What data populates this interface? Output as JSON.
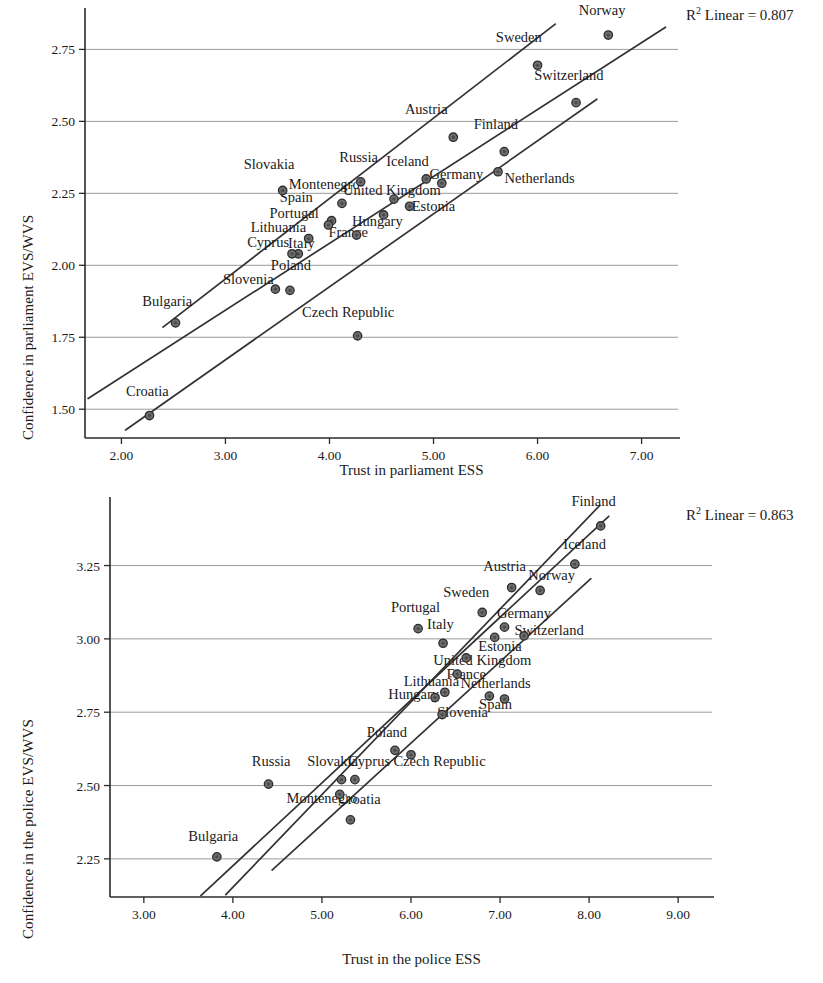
{
  "chart_data": [
    {
      "id": "parliament",
      "type": "scatter",
      "title": "",
      "xlabel": "Trust in parliament ESS",
      "ylabel": "Confidence in parliament EVS/WVS",
      "annotation": "R2 Linear = 0.807",
      "annotation_base": "R",
      "annotation_sup": "2",
      "annotation_rest": " Linear = 0.807",
      "r_squared": 0.807,
      "xlim": [
        1.65,
        7.35
      ],
      "ylim": [
        1.4,
        2.88
      ],
      "xticks": [
        "2.00",
        "3.00",
        "4.00",
        "5.00",
        "6.00",
        "7.00"
      ],
      "xtick_values": [
        2.0,
        3.0,
        4.0,
        5.0,
        6.0,
        7.0
      ],
      "yticks": [
        "1.50",
        "1.75",
        "2.00",
        "2.25",
        "2.50",
        "2.75"
      ],
      "ytick_values": [
        1.5,
        1.75,
        2.0,
        2.25,
        2.5,
        2.75
      ],
      "grid": "horizontal",
      "legend": "none",
      "points": [
        {
          "label": "Norway",
          "x": 6.68,
          "y": 2.8,
          "lx": 6.62,
          "ly": 2.87,
          "anchor": "middle"
        },
        {
          "label": "Sweden",
          "x": 6.0,
          "y": 2.695,
          "lx": 5.82,
          "ly": 2.775,
          "anchor": "middle"
        },
        {
          "label": "Switzerland",
          "x": 6.37,
          "y": 2.565,
          "lx": 6.3,
          "ly": 2.645,
          "anchor": "middle"
        },
        {
          "label": "Austria",
          "x": 5.19,
          "y": 2.445,
          "lx": 4.93,
          "ly": 2.525,
          "anchor": "middle"
        },
        {
          "label": "Finland",
          "x": 5.68,
          "y": 2.395,
          "lx": 5.6,
          "ly": 2.475,
          "anchor": "middle"
        },
        {
          "label": "Netherlands",
          "x": 5.62,
          "y": 2.325,
          "lx": 6.02,
          "ly": 2.285,
          "anchor": "middle"
        },
        {
          "label": "Germany",
          "x": 5.08,
          "y": 2.285,
          "lx": 5.22,
          "ly": 2.3,
          "anchor": "middle"
        },
        {
          "label": "Iceland",
          "x": 4.93,
          "y": 2.3,
          "lx": 4.75,
          "ly": 2.345,
          "anchor": "middle"
        },
        {
          "label": "Russia",
          "x": 4.3,
          "y": 2.29,
          "lx": 4.28,
          "ly": 2.36,
          "anchor": "middle"
        },
        {
          "label": "Slovakia",
          "x": 3.55,
          "y": 2.26,
          "lx": 3.42,
          "ly": 2.335,
          "anchor": "middle"
        },
        {
          "label": "United Kingdom",
          "x": 4.62,
          "y": 2.23,
          "lx": 4.6,
          "ly": 2.245,
          "anchor": "middle"
        },
        {
          "label": "Montenegro",
          "x": 4.12,
          "y": 2.215,
          "lx": 3.95,
          "ly": 2.265,
          "anchor": "middle"
        },
        {
          "label": "Estonia",
          "x": 4.77,
          "y": 2.205,
          "lx": 5.0,
          "ly": 2.19,
          "anchor": "middle"
        },
        {
          "label": "Spain",
          "x": 4.02,
          "y": 2.155,
          "lx": 3.68,
          "ly": 2.22,
          "anchor": "middle"
        },
        {
          "label": "Hungary",
          "x": 4.52,
          "y": 2.175,
          "lx": 4.46,
          "ly": 2.135,
          "anchor": "middle"
        },
        {
          "label": "Portugal",
          "x": 3.99,
          "y": 2.14,
          "lx": 3.66,
          "ly": 2.165,
          "anchor": "middle"
        },
        {
          "label": "France",
          "x": 4.26,
          "y": 2.105,
          "lx": 4.18,
          "ly": 2.1,
          "anchor": "middle"
        },
        {
          "label": "Lithuania",
          "x": 3.8,
          "y": 2.093,
          "lx": 3.51,
          "ly": 2.115,
          "anchor": "middle"
        },
        {
          "label": "Italy",
          "x": 3.7,
          "y": 2.04,
          "lx": 3.73,
          "ly": 2.06,
          "anchor": "middle"
        },
        {
          "label": "Cyprus",
          "x": 3.64,
          "y": 2.04,
          "lx": 3.41,
          "ly": 2.062,
          "anchor": "middle"
        },
        {
          "label": "Poland",
          "x": 3.62,
          "y": 1.913,
          "lx": 3.63,
          "ly": 1.985,
          "anchor": "middle"
        },
        {
          "label": "Slovenia",
          "x": 3.48,
          "y": 1.917,
          "lx": 3.22,
          "ly": 1.935,
          "anchor": "middle"
        },
        {
          "label": "Bulgaria",
          "x": 2.52,
          "y": 1.8,
          "lx": 2.44,
          "ly": 1.858,
          "anchor": "middle"
        },
        {
          "label": "Czech Republic",
          "x": 4.27,
          "y": 1.755,
          "lx": 4.18,
          "ly": 1.822,
          "anchor": "middle"
        },
        {
          "label": "Croatia",
          "x": 2.27,
          "y": 1.478,
          "lx": 2.25,
          "ly": 1.545,
          "anchor": "middle"
        }
      ],
      "fit_lines": [
        {
          "name": "regression-line",
          "x1": 1.68,
          "y1": 1.537,
          "x2": 7.23,
          "y2": 2.827
        },
        {
          "name": "upper-confidence-line",
          "x1": 2.4,
          "y1": 1.785,
          "x2": 6.17,
          "y2": 2.838
        },
        {
          "name": "lower-confidence-line",
          "x1": 2.04,
          "y1": 1.428,
          "x2": 6.57,
          "y2": 2.577
        }
      ]
    },
    {
      "id": "police",
      "type": "scatter",
      "title": "",
      "xlabel": "Trust in the police ESS",
      "ylabel": "Confidence in the police EVS/WVS",
      "annotation": "R2 Linear = 0.863",
      "annotation_base": "R",
      "annotation_sup": "2",
      "annotation_rest": " Linear = 0.863",
      "r_squared": 0.863,
      "xlim": [
        2.62,
        9.38
      ],
      "ylim": [
        2.12,
        3.47
      ],
      "xticks": [
        "3.00",
        "4.00",
        "5.00",
        "6.00",
        "7.00",
        "8.00",
        "9.00"
      ],
      "xtick_values": [
        3.0,
        4.0,
        5.0,
        6.0,
        7.0,
        8.0,
        9.0
      ],
      "yticks": [
        "2.25",
        "2.50",
        "2.75",
        "3.00",
        "3.25"
      ],
      "ytick_values": [
        2.25,
        2.5,
        2.75,
        3.0,
        3.25
      ],
      "grid": "horizontal",
      "legend": "none",
      "points": [
        {
          "label": "Finland",
          "x": 8.13,
          "y": 3.385,
          "lx": 8.05,
          "ly": 3.452,
          "anchor": "middle"
        },
        {
          "label": "Iceland",
          "x": 7.84,
          "y": 3.255,
          "lx": 7.95,
          "ly": 3.305,
          "anchor": "middle"
        },
        {
          "label": "Austria",
          "x": 7.13,
          "y": 3.175,
          "lx": 7.05,
          "ly": 3.233,
          "anchor": "middle"
        },
        {
          "label": "Norway",
          "x": 7.45,
          "y": 3.165,
          "lx": 7.58,
          "ly": 3.2,
          "anchor": "middle"
        },
        {
          "label": "Sweden",
          "x": 6.8,
          "y": 3.09,
          "lx": 6.62,
          "ly": 3.143,
          "anchor": "middle"
        },
        {
          "label": "Germany",
          "x": 7.05,
          "y": 3.04,
          "lx": 7.27,
          "ly": 3.07,
          "anchor": "middle"
        },
        {
          "label": "Switzerland",
          "x": 7.27,
          "y": 3.01,
          "lx": 7.55,
          "ly": 3.013,
          "anchor": "middle"
        },
        {
          "label": "Portugal",
          "x": 6.08,
          "y": 3.035,
          "lx": 6.05,
          "ly": 3.093,
          "anchor": "middle"
        },
        {
          "label": "Italy",
          "x": 6.36,
          "y": 2.985,
          "lx": 6.33,
          "ly": 3.033,
          "anchor": "middle"
        },
        {
          "label": "Estonia",
          "x": 6.94,
          "y": 3.005,
          "lx": 7.0,
          "ly": 2.96,
          "anchor": "middle"
        },
        {
          "label": "United Kingdom",
          "x": 6.62,
          "y": 2.935,
          "lx": 6.8,
          "ly": 2.91,
          "anchor": "middle"
        },
        {
          "label": "France",
          "x": 6.52,
          "y": 2.88,
          "lx": 6.62,
          "ly": 2.862,
          "anchor": "middle"
        },
        {
          "label": "Lithuania",
          "x": 6.38,
          "y": 2.818,
          "lx": 6.23,
          "ly": 2.838,
          "anchor": "middle"
        },
        {
          "label": "Netherlands",
          "x": 6.88,
          "y": 2.805,
          "lx": 6.95,
          "ly": 2.832,
          "anchor": "middle"
        },
        {
          "label": "Hungary",
          "x": 6.27,
          "y": 2.8,
          "lx": 6.03,
          "ly": 2.795,
          "anchor": "middle"
        },
        {
          "label": "Spain",
          "x": 7.05,
          "y": 2.795,
          "lx": 6.95,
          "ly": 2.76,
          "anchor": "middle"
        },
        {
          "label": "Slovenia",
          "x": 6.35,
          "y": 2.742,
          "lx": 6.58,
          "ly": 2.735,
          "anchor": "middle"
        },
        {
          "label": "Poland",
          "x": 5.82,
          "y": 2.62,
          "lx": 5.73,
          "ly": 2.665,
          "anchor": "middle"
        },
        {
          "label": "Czech Republic",
          "x": 6.0,
          "y": 2.605,
          "lx": 6.32,
          "ly": 2.565,
          "anchor": "middle"
        },
        {
          "label": "Cyprus",
          "x": 5.37,
          "y": 2.52,
          "lx": 5.53,
          "ly": 2.565,
          "anchor": "middle"
        },
        {
          "label": "Slovakia",
          "x": 5.22,
          "y": 2.52,
          "lx": 5.12,
          "ly": 2.567,
          "anchor": "middle"
        },
        {
          "label": "Russia",
          "x": 4.4,
          "y": 2.505,
          "lx": 4.43,
          "ly": 2.565,
          "anchor": "middle"
        },
        {
          "label": "Montenegro",
          "x": 5.2,
          "y": 2.47,
          "lx": 5.0,
          "ly": 2.442,
          "anchor": "middle"
        },
        {
          "label": "Croatia",
          "x": 5.32,
          "y": 2.383,
          "lx": 5.42,
          "ly": 2.437,
          "anchor": "middle"
        },
        {
          "label": "Bulgaria",
          "x": 3.82,
          "y": 2.257,
          "lx": 3.78,
          "ly": 2.31,
          "anchor": "middle"
        }
      ],
      "fit_lines": [
        {
          "name": "regression-line",
          "x1": 3.64,
          "y1": 2.125,
          "x2": 8.22,
          "y2": 3.418
        },
        {
          "name": "upper-confidence-line",
          "x1": 3.92,
          "y1": 2.128,
          "x2": 8.12,
          "y2": 3.455
        },
        {
          "name": "lower-confidence-line",
          "x1": 4.44,
          "y1": 2.212,
          "x2": 8.02,
          "y2": 3.205
        }
      ]
    }
  ]
}
